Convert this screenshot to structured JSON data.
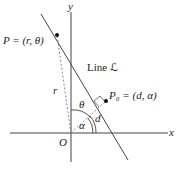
{
  "diagram": {
    "axes": {
      "x_label": "x",
      "y_label": "y",
      "origin_label": "O"
    },
    "line_label": "Line ℒ",
    "point_P": {
      "name": "P",
      "coords": "(r, θ)",
      "label": "P = (r, θ)"
    },
    "point_P0": {
      "name": "P₀",
      "coords": "(d, α)",
      "label": "P₀ = (d, α)"
    },
    "segment_labels": {
      "r": "r",
      "d": "d"
    },
    "angle_labels": {
      "theta": "θ",
      "alpha": "α"
    },
    "colors": {
      "ink": "#333333",
      "dashed": "#777777",
      "point": "#111111"
    }
  }
}
